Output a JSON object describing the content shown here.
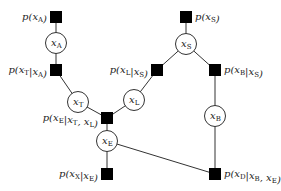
{
  "diagram": {
    "type": "factor-graph",
    "variables": [
      {
        "id": "xA",
        "base": "x",
        "sub": "A",
        "cx": 56,
        "cy": 43
      },
      {
        "id": "xT",
        "base": "x",
        "sub": "T",
        "cx": 78,
        "cy": 102
      },
      {
        "id": "xL",
        "base": "x",
        "sub": "L",
        "cx": 134,
        "cy": 100
      },
      {
        "id": "xS",
        "base": "x",
        "sub": "S",
        "cx": 186,
        "cy": 44
      },
      {
        "id": "xB",
        "base": "x",
        "sub": "B",
        "cx": 215,
        "cy": 116
      },
      {
        "id": "xE",
        "base": "x",
        "sub": "E",
        "cx": 107,
        "cy": 141
      }
    ],
    "factors": [
      {
        "id": "pA",
        "label": "p(x_A)",
        "text_parts": [
          "p(",
          "x",
          "A",
          ")"
        ],
        "x": 56,
        "y": 17,
        "label_side": "left"
      },
      {
        "id": "pTA",
        "label": "p(x_T|x_A)",
        "text_parts": [
          "p(",
          "x",
          "T",
          "|",
          "x",
          "A",
          ")"
        ],
        "x": 56,
        "y": 70,
        "label_side": "left"
      },
      {
        "id": "pS",
        "label": "p(x_S)",
        "text_parts": [
          "p(",
          "x",
          "S",
          ")"
        ],
        "x": 186,
        "y": 17,
        "label_side": "right"
      },
      {
        "id": "pLS",
        "label": "p(x_L|x_S)",
        "text_parts": [
          "p(",
          "x",
          "L",
          "|",
          "x",
          "S",
          ")"
        ],
        "x": 157,
        "y": 70,
        "label_side": "left"
      },
      {
        "id": "pBS",
        "label": "p(x_B|x_S)",
        "text_parts": [
          "p(",
          "x",
          "B",
          "|",
          "x",
          "S",
          ")"
        ],
        "x": 215,
        "y": 70,
        "label_side": "right"
      },
      {
        "id": "pETL",
        "label": "p(x_E|x_T, x_L)",
        "text_parts": [
          "p(",
          "x",
          "E",
          "|",
          "x",
          "T",
          ", ",
          "x",
          "L",
          ")"
        ],
        "x": 107,
        "y": 118,
        "label_side": "left"
      },
      {
        "id": "pXE",
        "label": "p(x_X|x_E)",
        "text_parts": [
          "p(",
          "x",
          "X",
          "|",
          "x",
          "E",
          ")"
        ],
        "x": 107,
        "y": 174,
        "label_side": "left"
      },
      {
        "id": "pDBE",
        "label": "p(x_D|x_B, x_E)",
        "text_parts": [
          "p(",
          "x",
          "D",
          "|",
          "x",
          "B",
          ", ",
          "x",
          "E",
          ")"
        ],
        "x": 215,
        "y": 174,
        "label_side": "right"
      }
    ],
    "edges": [
      [
        "pA",
        "xA"
      ],
      [
        "xA",
        "pTA"
      ],
      [
        "pTA",
        "xT"
      ],
      [
        "xT",
        "pETL"
      ],
      [
        "pS",
        "xS"
      ],
      [
        "xS",
        "pLS"
      ],
      [
        "xS",
        "pBS"
      ],
      [
        "pLS",
        "xL"
      ],
      [
        "xL",
        "pETL"
      ],
      [
        "pBS",
        "xB"
      ],
      [
        "xB",
        "pDBE"
      ],
      [
        "pETL",
        "xE"
      ],
      [
        "xE",
        "pXE"
      ],
      [
        "xE",
        "pDBE"
      ]
    ]
  }
}
